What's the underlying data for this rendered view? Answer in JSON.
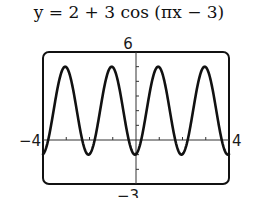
{
  "title": "y = 2 + 3 cos (πx − 3)",
  "chart_data": {
    "type": "line",
    "title": "y = 2 + 3 cos (πx − 3)",
    "function": "y = 2 + 3*cos(pi*x - 3)",
    "xlabel": "",
    "ylabel": "",
    "xlim": [
      -4,
      4
    ],
    "ylim": [
      -3,
      6
    ],
    "x_tick_step": 1,
    "y_tick_step": 1,
    "grid": false,
    "window_labels": {
      "xmin": "−4",
      "xmax": "4",
      "ymax": "6",
      "ymin": "−3"
    },
    "amplitude": 3,
    "vertical_shift": 2,
    "period": 2,
    "max_value": 5,
    "min_value": -1,
    "peaks_x": [
      -3.045,
      -1.045,
      0.955,
      2.955
    ],
    "troughs_x": [
      -2.045,
      -0.045,
      1.955,
      3.955
    ],
    "series": [
      {
        "name": "y = 2 + 3 cos (πx − 3)",
        "x": [
          -4,
          -3.5,
          -3.045,
          -2.5,
          -2.045,
          -1.5,
          -1.045,
          -0.5,
          -0.045,
          0,
          0.5,
          0.955,
          1.5,
          1.955,
          2.5,
          2.955,
          3.5,
          3.955,
          4
        ],
        "y": [
          -0.96,
          2.42,
          5,
          1.58,
          -1,
          2.42,
          5,
          1.58,
          -1,
          -0.97,
          2.42,
          5,
          1.58,
          -1,
          2.42,
          5,
          1.58,
          -1,
          -0.96
        ]
      }
    ]
  }
}
